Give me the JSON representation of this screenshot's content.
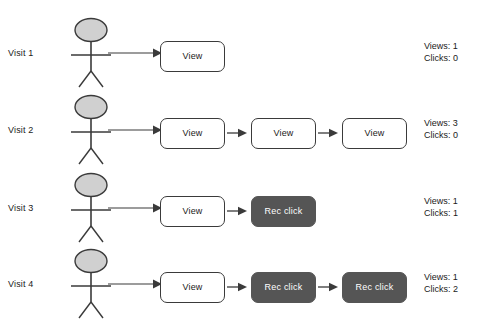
{
  "diagram": {
    "colors": {
      "view_box_fill": "#ffffff",
      "view_box_border": "#3a3a3a",
      "click_box_fill": "#555555",
      "click_box_text": "#ffffff",
      "actor_head_fill": "#d0d0d0",
      "actor_stroke": "#3a3a3a",
      "text": "#1a1a1a",
      "background": "#ffffff"
    },
    "rows": [
      {
        "label": "Visit 1",
        "steps": [
          {
            "type": "view",
            "label": "View"
          }
        ],
        "stats": {
          "views": "Views: 1",
          "clicks": "Clicks: 0"
        }
      },
      {
        "label": "Visit 2",
        "steps": [
          {
            "type": "view",
            "label": "View"
          },
          {
            "type": "view",
            "label": "View"
          },
          {
            "type": "view",
            "label": "View"
          }
        ],
        "stats": {
          "views": "Views: 3",
          "clicks": "Clicks: 0"
        }
      },
      {
        "label": "Visit 3",
        "steps": [
          {
            "type": "view",
            "label": "View"
          },
          {
            "type": "click",
            "label": "Rec click"
          }
        ],
        "stats": {
          "views": "Views: 1",
          "clicks": "Clicks: 1"
        }
      },
      {
        "label": "Visit 4",
        "steps": [
          {
            "type": "view",
            "label": "View"
          },
          {
            "type": "click",
            "label": "Rec click"
          },
          {
            "type": "click",
            "label": "Rec click"
          }
        ],
        "stats": {
          "views": "Views: 1",
          "clicks": "Clicks: 2"
        }
      }
    ]
  }
}
